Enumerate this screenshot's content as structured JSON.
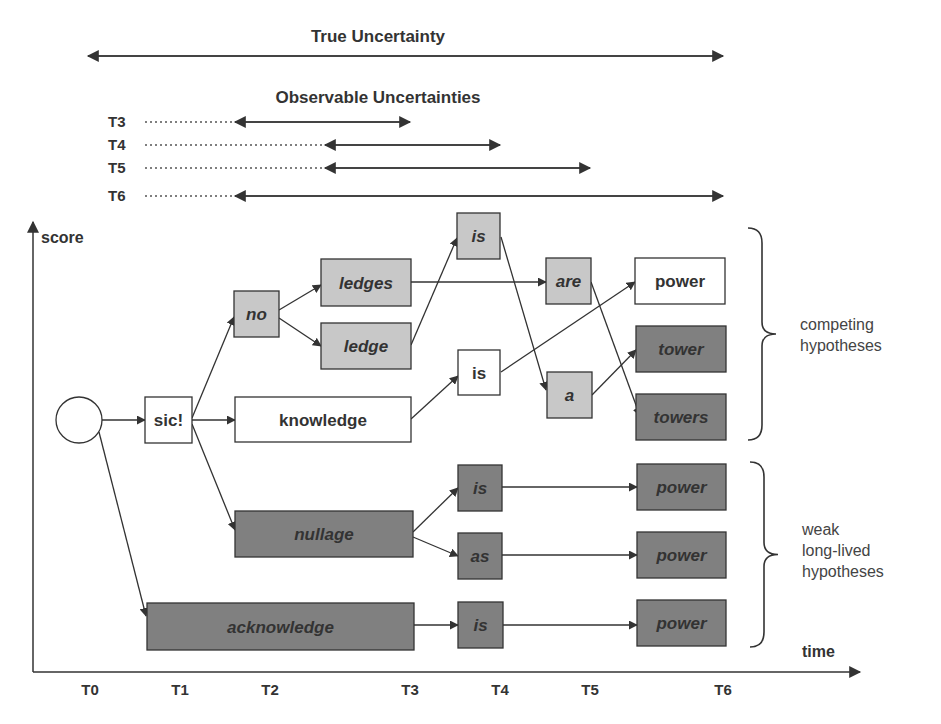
{
  "title": "True Uncertainty",
  "subtitle": "Observable Uncertainties",
  "colors": {
    "white": "#ffffff",
    "light": "#c8c8c8",
    "dark": "#808080",
    "line": "#333333"
  },
  "true_uncertainty": {
    "x1": 88,
    "x2": 723,
    "y": 56
  },
  "observable_rows": [
    {
      "label": "T3",
      "y": 122,
      "dot_x1": 145,
      "x1": 235,
      "x2": 410
    },
    {
      "label": "T4",
      "y": 145,
      "dot_x1": 145,
      "x1": 325,
      "x2": 500
    },
    {
      "label": "T5",
      "y": 168,
      "dot_x1": 145,
      "x1": 325,
      "x2": 590
    },
    {
      "label": "T6",
      "y": 196,
      "dot_x1": 145,
      "x1": 235,
      "x2": 723
    }
  ],
  "axes": {
    "y_label": "score",
    "x_label": "time",
    "ticks": [
      {
        "label": "T0",
        "x": 90
      },
      {
        "label": "T1",
        "x": 180
      },
      {
        "label": "T2",
        "x": 270
      },
      {
        "label": "T3",
        "x": 410
      },
      {
        "label": "T4",
        "x": 500
      },
      {
        "label": "T5",
        "x": 590
      },
      {
        "label": "T6",
        "x": 723
      }
    ]
  },
  "start_node": {
    "cx": 79,
    "cy": 420,
    "r": 23
  },
  "nodes": [
    {
      "id": "sic",
      "label": "sic!",
      "x": 145,
      "y": 397,
      "w": 47,
      "h": 46,
      "fill": "white",
      "italic": false
    },
    {
      "id": "no",
      "label": "no",
      "x": 234,
      "y": 291,
      "w": 45,
      "h": 46,
      "fill": "light",
      "italic": true
    },
    {
      "id": "knowledge",
      "label": "knowledge",
      "x": 235,
      "y": 397,
      "w": 176,
      "h": 45,
      "fill": "white",
      "italic": false
    },
    {
      "id": "nullage",
      "label": "nullage",
      "x": 235,
      "y": 511,
      "w": 178,
      "h": 46,
      "fill": "dark",
      "italic": true
    },
    {
      "id": "acknowledge",
      "label": "acknowledge",
      "x": 147,
      "y": 603,
      "w": 267,
      "h": 47,
      "fill": "dark",
      "italic": true
    },
    {
      "id": "ledges",
      "label": "ledges",
      "x": 321,
      "y": 259,
      "w": 90,
      "h": 47,
      "fill": "light",
      "italic": true
    },
    {
      "id": "ledge",
      "label": "ledge",
      "x": 321,
      "y": 323,
      "w": 90,
      "h": 46,
      "fill": "light",
      "italic": true
    },
    {
      "id": "is_top",
      "label": "is",
      "x": 457,
      "y": 213,
      "w": 43,
      "h": 46,
      "fill": "light",
      "italic": true
    },
    {
      "id": "is_mid",
      "label": "is",
      "x": 458,
      "y": 350,
      "w": 42,
      "h": 45,
      "fill": "white",
      "italic": false
    },
    {
      "id": "is_w1",
      "label": "is",
      "x": 458,
      "y": 465,
      "w": 44,
      "h": 46,
      "fill": "dark",
      "italic": true
    },
    {
      "id": "as_w2",
      "label": "as",
      "x": 458,
      "y": 533,
      "w": 44,
      "h": 46,
      "fill": "dark",
      "italic": true
    },
    {
      "id": "is_w3",
      "label": "is",
      "x": 458,
      "y": 602,
      "w": 45,
      "h": 46,
      "fill": "dark",
      "italic": true
    },
    {
      "id": "are",
      "label": "are",
      "x": 546,
      "y": 258,
      "w": 45,
      "h": 46,
      "fill": "light",
      "italic": true
    },
    {
      "id": "a",
      "label": "a",
      "x": 547,
      "y": 372,
      "w": 45,
      "h": 46,
      "fill": "light",
      "italic": true
    },
    {
      "id": "power_top",
      "label": "power",
      "x": 635,
      "y": 258,
      "w": 90,
      "h": 46,
      "fill": "white",
      "italic": false
    },
    {
      "id": "tower",
      "label": "tower",
      "x": 636,
      "y": 326,
      "w": 90,
      "h": 46,
      "fill": "dark",
      "italic": true
    },
    {
      "id": "towers",
      "label": "towers",
      "x": 636,
      "y": 394,
      "w": 90,
      "h": 46,
      "fill": "dark",
      "italic": true
    },
    {
      "id": "power_w1",
      "label": "power",
      "x": 637,
      "y": 464,
      "w": 89,
      "h": 46,
      "fill": "dark",
      "italic": true
    },
    {
      "id": "power_w2",
      "label": "power",
      "x": 637,
      "y": 532,
      "w": 89,
      "h": 46,
      "fill": "dark",
      "italic": true
    },
    {
      "id": "power_w3",
      "label": "power",
      "x": 637,
      "y": 600,
      "w": 89,
      "h": 46,
      "fill": "dark",
      "italic": true
    }
  ],
  "edges": [
    {
      "from": "start",
      "to": "sic",
      "x1": 102,
      "y1": 420,
      "x2": 145,
      "y2": 420
    },
    {
      "from": "start",
      "to": "acknowledge",
      "x1": 99,
      "y1": 432,
      "x2": 146,
      "y2": 616
    },
    {
      "from": "sic",
      "to": "no",
      "x1": 192,
      "y1": 418,
      "x2": 234,
      "y2": 317
    },
    {
      "from": "sic",
      "to": "knowledge",
      "x1": 192,
      "y1": 420,
      "x2": 235,
      "y2": 420
    },
    {
      "from": "sic",
      "to": "nullage",
      "x1": 192,
      "y1": 424,
      "x2": 235,
      "y2": 530
    },
    {
      "from": "no",
      "to": "ledges",
      "x1": 279,
      "y1": 310,
      "x2": 321,
      "y2": 285
    },
    {
      "from": "no",
      "to": "ledge",
      "x1": 279,
      "y1": 318,
      "x2": 321,
      "y2": 346
    },
    {
      "from": "ledges",
      "to": "are",
      "x1": 411,
      "y1": 282,
      "x2": 546,
      "y2": 282
    },
    {
      "from": "ledge",
      "to": "is_top",
      "x1": 411,
      "y1": 345,
      "x2": 457,
      "y2": 238
    },
    {
      "from": "knowledge",
      "to": "is_mid",
      "x1": 411,
      "y1": 419,
      "x2": 458,
      "y2": 376
    },
    {
      "from": "is_top",
      "to": "a",
      "x1": 501,
      "y1": 237,
      "x2": 546,
      "y2": 390
    },
    {
      "from": "is_mid",
      "to": "power_top",
      "x1": 501,
      "y1": 372,
      "x2": 635,
      "y2": 282
    },
    {
      "from": "are",
      "to": "towers",
      "x1": 591,
      "y1": 282,
      "x2": 640,
      "y2": 416
    },
    {
      "from": "a",
      "to": "tower",
      "x1": 592,
      "y1": 395,
      "x2": 636,
      "y2": 350
    },
    {
      "from": "nullage",
      "to": "is_w1",
      "x1": 413,
      "y1": 532,
      "x2": 458,
      "y2": 488
    },
    {
      "from": "nullage",
      "to": "as_w2",
      "x1": 413,
      "y1": 537,
      "x2": 458,
      "y2": 556
    },
    {
      "from": "acknowledge",
      "to": "is_w3",
      "x1": 414,
      "y1": 625,
      "x2": 458,
      "y2": 625
    },
    {
      "from": "is_w1",
      "to": "power_w1",
      "x1": 502,
      "y1": 487,
      "x2": 637,
      "y2": 487
    },
    {
      "from": "as_w2",
      "to": "power_w2",
      "x1": 502,
      "y1": 555,
      "x2": 637,
      "y2": 555
    },
    {
      "from": "is_w3",
      "to": "power_w3",
      "x1": 503,
      "y1": 625,
      "x2": 637,
      "y2": 625
    }
  ],
  "braces": [
    {
      "id": "competing",
      "x": 748,
      "y1": 228,
      "y2": 440,
      "lines": [
        "competing",
        "hypotheses"
      ],
      "text_x": 800,
      "text_y": 330
    },
    {
      "id": "weak",
      "x": 750,
      "y1": 462,
      "y2": 647,
      "lines": [
        "weak",
        "long-lived",
        "hypotheses"
      ],
      "text_x": 802,
      "text_y": 535
    }
  ]
}
